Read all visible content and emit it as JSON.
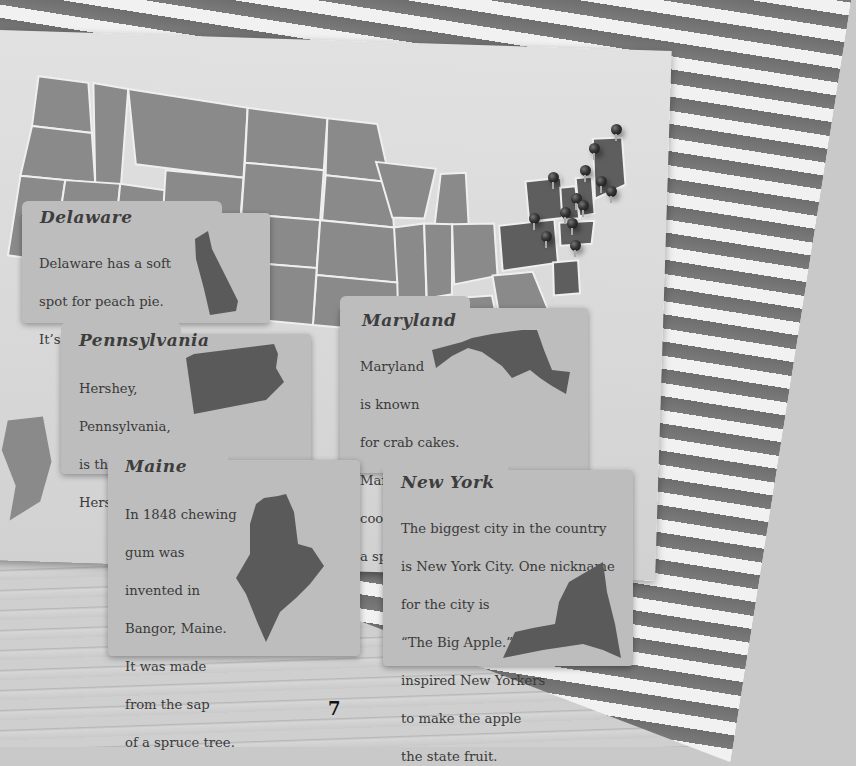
{
  "map": {
    "description": "Map of the United States with pins on northeastern states",
    "pin_count": 13,
    "colors": {
      "state_fill": "#8a8a8a",
      "highlight_fill": "#5e5e5e",
      "borders": "#f0f0f0",
      "paper": "#dcdcdc"
    }
  },
  "cards": [
    {
      "id": "delaware",
      "title": "Delaware",
      "lines": [
        "Delaware has a soft",
        "spot for peach pie.",
        "It’s their state "
      ],
      "bold_word": "dessert",
      "trailing": ".",
      "shape": "delaware-silhouette"
    },
    {
      "id": "pennsylvania",
      "title": "Pennsylvania",
      "lines": [
        "Hershey,",
        "Pennsylvania,",
        "is the home of",
        "Hershey’s chocolate."
      ],
      "shape": "pennsylvania-silhouette"
    },
    {
      "id": "maryland",
      "title": "Maryland",
      "lines": [
        "Maryland",
        "is known",
        "for crab cakes.",
        "Many people catch and",
        "cook their own crabs as",
        "a special treat!"
      ],
      "shape": "maryland-silhouette"
    },
    {
      "id": "maine",
      "title": "Maine",
      "lines": [
        "In 1848 chewing",
        "gum was",
        "invented in",
        "Bangor, Maine.",
        "It was made",
        "from the sap",
        "of a spruce tree."
      ],
      "shape": "maine-silhouette"
    },
    {
      "id": "new-york",
      "title": "New York",
      "lines": [
        "The biggest city in the country",
        "is New York City. One nickname",
        "for the city is",
        "“The Big Apple.” It",
        "inspired New Yorkers",
        "to make the apple",
        "the state fruit."
      ],
      "shape": "new-york-silhouette"
    }
  ],
  "page": {
    "number": "7"
  },
  "colors": {
    "card": "#bdbdbd",
    "text": "#3a3a3a",
    "silhouette": "#5a5a5a"
  }
}
